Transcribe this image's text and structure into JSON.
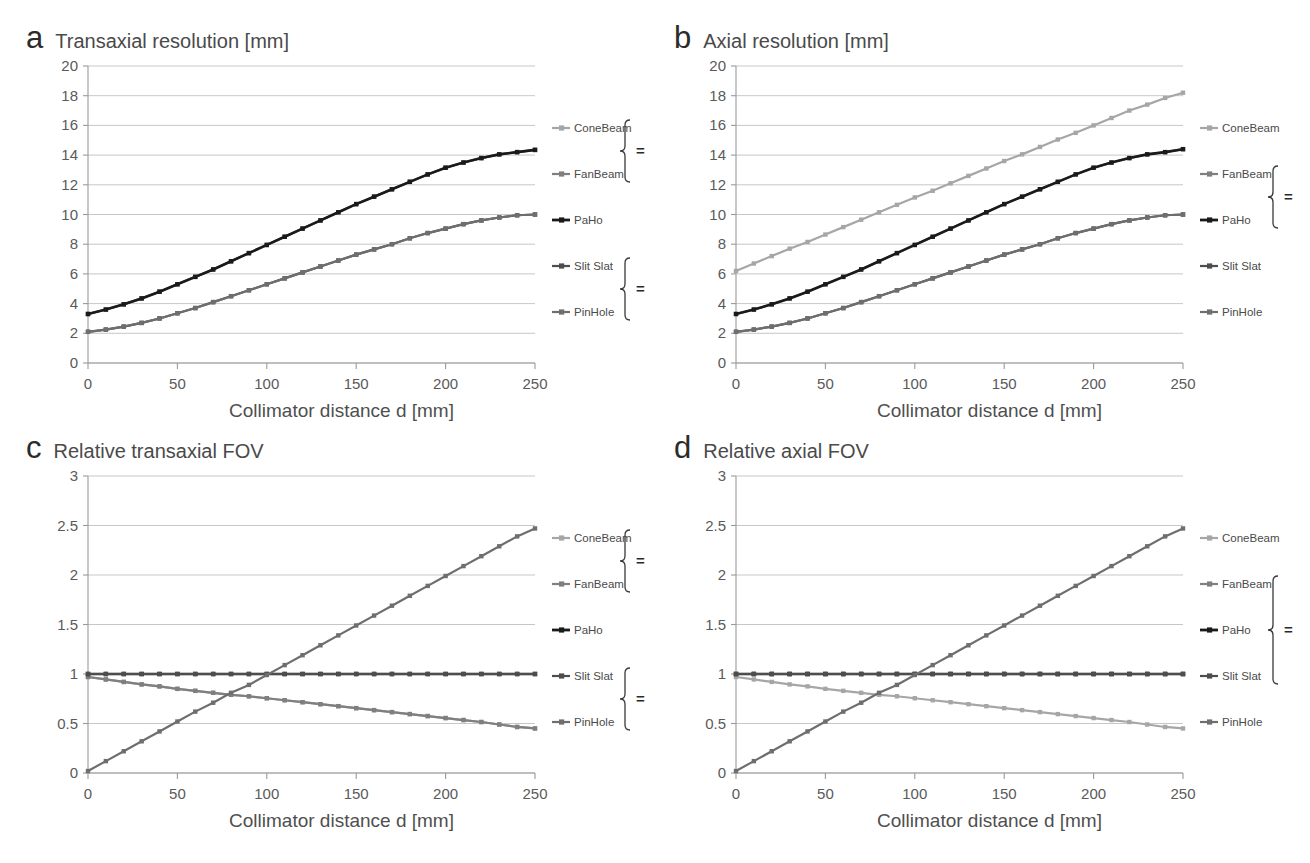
{
  "figure": {
    "background": "#ffffff",
    "series_colors": {
      "ConeBeam": "#a6a6a6",
      "FanBeam": "#7f7f7f",
      "PaHo": "#1a1a1a",
      "Slit Slat": "#4d4d4d",
      "PinHole": "#6e6e6e"
    },
    "legend_equals_symbol": "=",
    "shared_xlabel": "Collimator distance d [mm]"
  },
  "panels": [
    {
      "id": "a",
      "letter": "a",
      "title": "Transaxial resolution [mm]",
      "legend": {
        "items": [
          "ConeBeam",
          "FanBeam",
          "PaHo",
          "Slit Slat",
          "PinHole"
        ],
        "groups": [
          {
            "members": [
              "ConeBeam",
              "FanBeam"
            ],
            "equals": "="
          },
          {
            "members": [
              "Slit Slat",
              "PinHole"
            ],
            "equals": "="
          }
        ]
      },
      "chart_data": {
        "type": "line",
        "title": "Transaxial resolution [mm]",
        "xlabel": "Collimator distance d [mm]",
        "ylabel": "Transaxial resolution [mm]",
        "xlim": [
          0,
          250
        ],
        "ylim": [
          0,
          20
        ],
        "xticks": [
          0,
          50,
          100,
          150,
          200,
          250
        ],
        "yticks": [
          0,
          2,
          4,
          6,
          8,
          10,
          12,
          14,
          16,
          18,
          20
        ],
        "grid": true,
        "legend_position": "right",
        "x": [
          0,
          10,
          20,
          30,
          40,
          50,
          60,
          70,
          80,
          90,
          100,
          110,
          120,
          130,
          140,
          150,
          160,
          170,
          180,
          190,
          200,
          210,
          220,
          230,
          240,
          250
        ],
        "series": [
          {
            "name": "ConeBeam",
            "values": [
              3.3,
              3.6,
              3.95,
              4.35,
              4.8,
              5.3,
              5.8,
              6.3,
              6.85,
              7.4,
              7.95,
              8.5,
              9.05,
              9.6,
              10.15,
              10.7,
              11.2,
              11.7,
              12.2,
              12.7,
              13.15,
              13.5,
              13.8,
              14.05,
              14.2,
              14.35
            ]
          },
          {
            "name": "FanBeam",
            "values": [
              3.3,
              3.6,
              3.95,
              4.35,
              4.8,
              5.3,
              5.8,
              6.3,
              6.85,
              7.4,
              7.95,
              8.5,
              9.05,
              9.6,
              10.15,
              10.7,
              11.2,
              11.7,
              12.2,
              12.7,
              13.15,
              13.5,
              13.8,
              14.05,
              14.2,
              14.35
            ]
          },
          {
            "name": "PaHo",
            "values": [
              3.3,
              3.6,
              3.95,
              4.35,
              4.8,
              5.3,
              5.8,
              6.3,
              6.85,
              7.4,
              7.95,
              8.5,
              9.05,
              9.6,
              10.15,
              10.7,
              11.2,
              11.7,
              12.2,
              12.7,
              13.15,
              13.5,
              13.8,
              14.05,
              14.2,
              14.35
            ]
          },
          {
            "name": "Slit Slat",
            "values": [
              2.1,
              2.25,
              2.45,
              2.7,
              3.0,
              3.35,
              3.7,
              4.1,
              4.5,
              4.9,
              5.3,
              5.7,
              6.1,
              6.5,
              6.9,
              7.3,
              7.65,
              8.0,
              8.4,
              8.75,
              9.05,
              9.35,
              9.6,
              9.8,
              9.95,
              10.0
            ]
          },
          {
            "name": "PinHole",
            "values": [
              2.1,
              2.25,
              2.45,
              2.7,
              3.0,
              3.35,
              3.7,
              4.1,
              4.5,
              4.9,
              5.3,
              5.7,
              6.1,
              6.5,
              6.9,
              7.3,
              7.65,
              8.0,
              8.4,
              8.75,
              9.05,
              9.35,
              9.6,
              9.8,
              9.95,
              10.0
            ]
          }
        ]
      }
    },
    {
      "id": "b",
      "letter": "b",
      "title": "Axial resolution [mm]",
      "legend": {
        "items": [
          "ConeBeam",
          "FanBeam",
          "PaHo",
          "Slit Slat",
          "PinHole"
        ],
        "groups": [
          {
            "members": [
              "FanBeam",
              "PaHo"
            ],
            "equals": "="
          }
        ]
      },
      "chart_data": {
        "type": "line",
        "title": "Axial resolution [mm]",
        "xlabel": "Collimator distance d [mm]",
        "ylabel": "Axial resolution [mm]",
        "xlim": [
          0,
          250
        ],
        "ylim": [
          0,
          20
        ],
        "xticks": [
          0,
          50,
          100,
          150,
          200,
          250
        ],
        "yticks": [
          0,
          2,
          4,
          6,
          8,
          10,
          12,
          14,
          16,
          18,
          20
        ],
        "grid": true,
        "legend_position": "right",
        "x": [
          0,
          10,
          20,
          30,
          40,
          50,
          60,
          70,
          80,
          90,
          100,
          110,
          120,
          130,
          140,
          150,
          160,
          170,
          180,
          190,
          200,
          210,
          220,
          230,
          240,
          250
        ],
        "series": [
          {
            "name": "ConeBeam",
            "values": [
              6.2,
              6.7,
              7.2,
              7.7,
              8.15,
              8.65,
              9.15,
              9.65,
              10.15,
              10.65,
              11.15,
              11.6,
              12.1,
              12.6,
              13.1,
              13.6,
              14.05,
              14.55,
              15.05,
              15.5,
              16.0,
              16.5,
              17.0,
              17.4,
              17.85,
              18.2
            ]
          },
          {
            "name": "FanBeam",
            "values": [
              3.3,
              3.6,
              3.95,
              4.35,
              4.8,
              5.3,
              5.8,
              6.3,
              6.85,
              7.4,
              7.95,
              8.5,
              9.05,
              9.6,
              10.15,
              10.7,
              11.2,
              11.7,
              12.2,
              12.7,
              13.15,
              13.5,
              13.8,
              14.05,
              14.2,
              14.4
            ]
          },
          {
            "name": "PaHo",
            "values": [
              3.3,
              3.6,
              3.95,
              4.35,
              4.8,
              5.3,
              5.8,
              6.3,
              6.85,
              7.4,
              7.95,
              8.5,
              9.05,
              9.6,
              10.15,
              10.7,
              11.2,
              11.7,
              12.2,
              12.7,
              13.15,
              13.5,
              13.8,
              14.05,
              14.2,
              14.4
            ]
          },
          {
            "name": "Slit Slat",
            "values": [
              2.1,
              2.25,
              2.45,
              2.7,
              3.0,
              3.35,
              3.7,
              4.1,
              4.5,
              4.9,
              5.3,
              5.7,
              6.1,
              6.5,
              6.9,
              7.3,
              7.65,
              8.0,
              8.4,
              8.75,
              9.05,
              9.35,
              9.6,
              9.8,
              9.95,
              10.0
            ]
          },
          {
            "name": "PinHole",
            "values": [
              2.1,
              2.25,
              2.45,
              2.7,
              3.0,
              3.35,
              3.7,
              4.1,
              4.5,
              4.9,
              5.3,
              5.7,
              6.1,
              6.5,
              6.9,
              7.3,
              7.65,
              8.0,
              8.4,
              8.75,
              9.05,
              9.35,
              9.6,
              9.8,
              9.95,
              10.0
            ]
          }
        ]
      }
    },
    {
      "id": "c",
      "letter": "c",
      "title": "Relative transaxial FOV",
      "legend": {
        "items": [
          "ConeBeam",
          "FanBeam",
          "PaHo",
          "Slit Slat",
          "PinHole"
        ],
        "groups": [
          {
            "members": [
              "ConeBeam",
              "FanBeam"
            ],
            "equals": "="
          },
          {
            "members": [
              "Slit Slat",
              "PinHole"
            ],
            "equals": "="
          }
        ]
      },
      "chart_data": {
        "type": "line",
        "title": "Relative transaxial FOV",
        "xlabel": "Collimator distance d [mm]",
        "ylabel": "Relative transaxial FOV",
        "xlim": [
          0,
          250
        ],
        "ylim": [
          0,
          3
        ],
        "xticks": [
          0,
          50,
          100,
          150,
          200,
          250
        ],
        "yticks": [
          0,
          0.5,
          1,
          1.5,
          2,
          2.5,
          3
        ],
        "grid": true,
        "legend_position": "right",
        "x": [
          0,
          10,
          20,
          30,
          40,
          50,
          60,
          70,
          80,
          90,
          100,
          110,
          120,
          130,
          140,
          150,
          160,
          170,
          180,
          190,
          200,
          210,
          220,
          230,
          240,
          250
        ],
        "series": [
          {
            "name": "ConeBeam",
            "values": [
              0.97,
              0.945,
              0.92,
              0.895,
              0.875,
              0.85,
              0.83,
              0.81,
              0.79,
              0.775,
              0.755,
              0.735,
              0.715,
              0.695,
              0.675,
              0.655,
              0.635,
              0.615,
              0.595,
              0.575,
              0.555,
              0.535,
              0.515,
              0.49,
              0.465,
              0.45
            ]
          },
          {
            "name": "FanBeam",
            "values": [
              0.97,
              0.945,
              0.92,
              0.895,
              0.875,
              0.85,
              0.83,
              0.81,
              0.79,
              0.775,
              0.755,
              0.735,
              0.715,
              0.695,
              0.675,
              0.655,
              0.635,
              0.615,
              0.595,
              0.575,
              0.555,
              0.535,
              0.515,
              0.49,
              0.465,
              0.45
            ]
          },
          {
            "name": "PaHo",
            "values": [
              1.0,
              1.0,
              1.0,
              1.0,
              1.0,
              1.0,
              1.0,
              1.0,
              1.0,
              1.0,
              1.0,
              1.0,
              1.0,
              1.0,
              1.0,
              1.0,
              1.0,
              1.0,
              1.0,
              1.0,
              1.0,
              1.0,
              1.0,
              1.0,
              1.0,
              1.0
            ]
          },
          {
            "name": "Slit Slat",
            "values": [
              1.0,
              1.0,
              1.0,
              1.0,
              1.0,
              1.0,
              1.0,
              1.0,
              1.0,
              1.0,
              1.0,
              1.0,
              1.0,
              1.0,
              1.0,
              1.0,
              1.0,
              1.0,
              1.0,
              1.0,
              1.0,
              1.0,
              1.0,
              1.0,
              1.0,
              1.0
            ]
          },
          {
            "name": "PinHole",
            "values": [
              0.02,
              0.12,
              0.22,
              0.32,
              0.42,
              0.52,
              0.62,
              0.71,
              0.81,
              0.89,
              0.99,
              1.09,
              1.19,
              1.29,
              1.39,
              1.49,
              1.59,
              1.69,
              1.79,
              1.89,
              1.99,
              2.09,
              2.19,
              2.29,
              2.39,
              2.47
            ]
          }
        ]
      }
    },
    {
      "id": "d",
      "letter": "d",
      "title": "Relative axial FOV",
      "legend": {
        "items": [
          "ConeBeam",
          "FanBeam",
          "PaHo",
          "Slit Slat",
          "PinHole"
        ],
        "groups": [
          {
            "members": [
              "FanBeam",
              "PaHo",
              "Slit Slat"
            ],
            "equals": "="
          }
        ]
      },
      "chart_data": {
        "type": "line",
        "title": "Relative axial FOV",
        "xlabel": "Collimator distance d [mm]",
        "ylabel": "Relative axial FOV",
        "xlim": [
          0,
          250
        ],
        "ylim": [
          0,
          3
        ],
        "xticks": [
          0,
          50,
          100,
          150,
          200,
          250
        ],
        "yticks": [
          0,
          0.5,
          1,
          1.5,
          2,
          2.5,
          3
        ],
        "grid": true,
        "legend_position": "right",
        "x": [
          0,
          10,
          20,
          30,
          40,
          50,
          60,
          70,
          80,
          90,
          100,
          110,
          120,
          130,
          140,
          150,
          160,
          170,
          180,
          190,
          200,
          210,
          220,
          230,
          240,
          250
        ],
        "series": [
          {
            "name": "ConeBeam",
            "values": [
              0.97,
              0.945,
              0.92,
              0.895,
              0.875,
              0.85,
              0.83,
              0.81,
              0.79,
              0.775,
              0.755,
              0.735,
              0.715,
              0.695,
              0.675,
              0.655,
              0.635,
              0.615,
              0.595,
              0.575,
              0.555,
              0.535,
              0.515,
              0.49,
              0.465,
              0.45
            ]
          },
          {
            "name": "FanBeam",
            "values": [
              1.0,
              1.0,
              1.0,
              1.0,
              1.0,
              1.0,
              1.0,
              1.0,
              1.0,
              1.0,
              1.0,
              1.0,
              1.0,
              1.0,
              1.0,
              1.0,
              1.0,
              1.0,
              1.0,
              1.0,
              1.0,
              1.0,
              1.0,
              1.0,
              1.0,
              1.0
            ]
          },
          {
            "name": "PaHo",
            "values": [
              1.0,
              1.0,
              1.0,
              1.0,
              1.0,
              1.0,
              1.0,
              1.0,
              1.0,
              1.0,
              1.0,
              1.0,
              1.0,
              1.0,
              1.0,
              1.0,
              1.0,
              1.0,
              1.0,
              1.0,
              1.0,
              1.0,
              1.0,
              1.0,
              1.0,
              1.0
            ]
          },
          {
            "name": "Slit Slat",
            "values": [
              1.0,
              1.0,
              1.0,
              1.0,
              1.0,
              1.0,
              1.0,
              1.0,
              1.0,
              1.0,
              1.0,
              1.0,
              1.0,
              1.0,
              1.0,
              1.0,
              1.0,
              1.0,
              1.0,
              1.0,
              1.0,
              1.0,
              1.0,
              1.0,
              1.0,
              1.0
            ]
          },
          {
            "name": "PinHole",
            "values": [
              0.02,
              0.12,
              0.22,
              0.32,
              0.42,
              0.52,
              0.62,
              0.71,
              0.81,
              0.89,
              0.99,
              1.09,
              1.19,
              1.29,
              1.39,
              1.49,
              1.59,
              1.69,
              1.79,
              1.89,
              1.99,
              2.09,
              2.19,
              2.29,
              2.39,
              2.47
            ]
          }
        ]
      }
    }
  ]
}
